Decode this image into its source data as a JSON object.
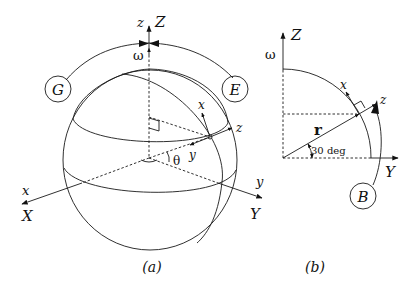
{
  "figure": {
    "panel_a": {
      "caption": "(a)",
      "labels": {
        "z_body": "z",
        "Z_inertial": "Z",
        "omega": "ω",
        "G": "G",
        "E": "E",
        "x_local": "x",
        "z_local": "z",
        "y_local": "y",
        "theta": "θ",
        "x_body": "x",
        "X_inertial": "X",
        "y_body": "y",
        "Y_inertial": "Y"
      }
    },
    "panel_b": {
      "caption": "(b)",
      "labels": {
        "Z_inertial": "Z",
        "omega": "ω",
        "x_local": "x",
        "z_local": "z",
        "r_vector": "r",
        "angle": "30 deg",
        "Y_inertial": "Y",
        "B": "B"
      }
    }
  }
}
